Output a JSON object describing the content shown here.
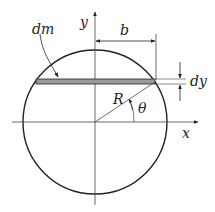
{
  "diagram": {
    "labels": {
      "y_axis": "y",
      "x_axis": "x",
      "mass_element": "dm",
      "half_width": "b",
      "thickness": "dy",
      "radius": "R",
      "angle": "θ"
    },
    "colors": {
      "stroke": "#222222",
      "strip_fill": "#9a9a9a"
    }
  }
}
